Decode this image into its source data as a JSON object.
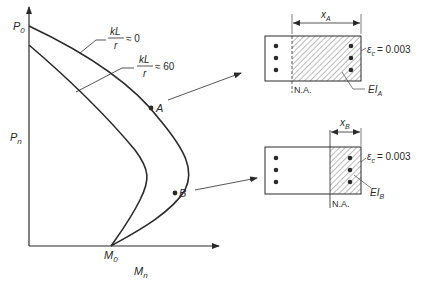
{
  "diagram": {
    "type": "interaction-diagram",
    "axes": {
      "y_label": "P",
      "y_label_sub": "n",
      "x_label": "M",
      "x_label_sub": "n",
      "y_top_label": "P",
      "y_top_label_sub": "0",
      "x_origin_label": "M",
      "x_origin_label_sub": "0"
    },
    "curves": [
      {
        "name": "kL/r ≈ 0",
        "num": "kL",
        "den": "r",
        "approx": "≈ 0"
      },
      {
        "name": "kL/r ≈ 60",
        "num": "kL",
        "den": "r",
        "approx": "≈ 60"
      }
    ],
    "points": [
      {
        "label": "A"
      },
      {
        "label": "B"
      }
    ],
    "sections": [
      {
        "id": "A",
        "depth_label": "x",
        "depth_sub": "A",
        "strain_symbol": "ε",
        "strain_sub": "c",
        "strain_value": "= 0.003",
        "stiffness_label": "EI",
        "stiffness_sub": "A",
        "na_label": "N.A."
      },
      {
        "id": "B",
        "depth_label": "x",
        "depth_sub": "B",
        "strain_symbol": "ε",
        "strain_sub": "c",
        "strain_value": "= 0.003",
        "stiffness_label": "EI",
        "stiffness_sub": "B",
        "na_label": "N.A."
      }
    ],
    "colors": {
      "ink": "#2a2a2a",
      "background": "#ffffff"
    }
  }
}
